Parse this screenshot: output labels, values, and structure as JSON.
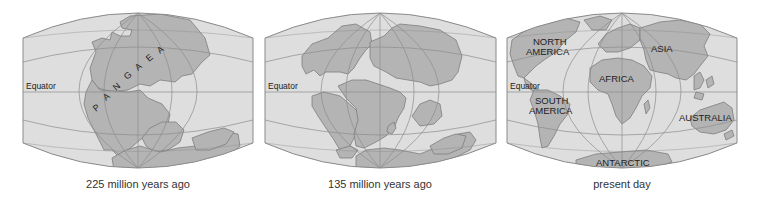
{
  "figure": {
    "colors": {
      "ocean": "#dedede",
      "land": "#b4b4b4",
      "land_stroke": "#7e7e7e",
      "grid": "#8c8c8c",
      "border": "#8a8a8a",
      "text": "#222222"
    },
    "panels": [
      {
        "id": "pangaea",
        "caption": "225 million years ago",
        "equator_label": "Equator",
        "labels": [
          {
            "text": "P"
          },
          {
            "text": "A"
          },
          {
            "text": "N"
          },
          {
            "text": "G"
          },
          {
            "text": "A"
          },
          {
            "text": "E"
          },
          {
            "text": "A"
          }
        ]
      },
      {
        "id": "cretaceous",
        "caption": "135 million years ago",
        "equator_label": "Equator",
        "labels": []
      },
      {
        "id": "present",
        "caption": "present day",
        "equator_label": "Equator",
        "labels": [
          {
            "text": "NORTH"
          },
          {
            "text": "AMERICA"
          },
          {
            "text": "SOUTH"
          },
          {
            "text": "AMERICA"
          },
          {
            "text": "AFRICA"
          },
          {
            "text": "ASIA"
          },
          {
            "text": "AUSTRALIA"
          },
          {
            "text": "ANTARCTIC"
          }
        ]
      }
    ]
  }
}
